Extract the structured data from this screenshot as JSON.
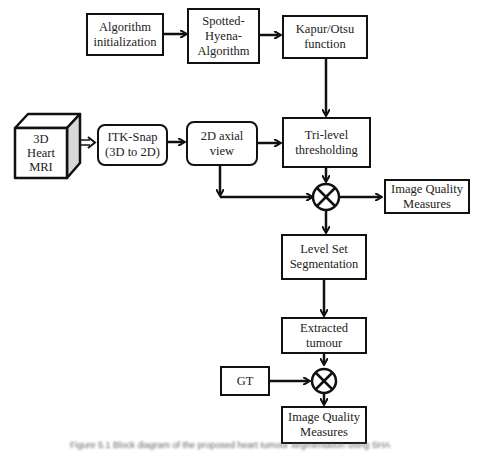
{
  "diagram": {
    "nodes": {
      "algo_init": "Algorithm initialization",
      "spotted_hyena": "Spotted-Hyena-Algorithm",
      "kapur_otsu": "Kapur/Otsu function",
      "heart_mri": "3D Heart MRI",
      "itk_snap": "ITK-Snap (3D to 2D)",
      "axial_view": "2D axial view",
      "tri_level": "Tri-level thresholding",
      "iqm1": "Image Quality Measures",
      "level_set": "Level Set Segmentation",
      "extracted": "Extracted tumour",
      "gt": "GT",
      "iqm2": "Image Quality Measures"
    },
    "lines": {
      "algo_init": [
        "Algorithm",
        "initialization"
      ],
      "spotted_hyena": [
        "Spotted-",
        "Hyena-",
        "Algorithm"
      ],
      "kapur_otsu": [
        "Kapur/Otsu",
        "function"
      ],
      "heart_mri": [
        "3D",
        "Heart",
        "MRI"
      ],
      "itk_snap": [
        "ITK-Snap",
        "(3D to 2D)"
      ],
      "axial_view": [
        "2D axial",
        "view"
      ],
      "tri_level": [
        "Tri-level",
        "thresholding"
      ],
      "iqm1": [
        "Image Quality",
        "Measures"
      ],
      "level_set": [
        "Level Set",
        "Segmentation"
      ],
      "extracted": [
        "Extracted",
        "tumour"
      ],
      "gt": [
        "GT"
      ],
      "iqm2": [
        "Image Quality",
        "Measures"
      ]
    },
    "edges": [
      [
        "Algorithm initialization",
        "Spotted-Hyena-Algorithm"
      ],
      [
        "Spotted-Hyena-Algorithm",
        "Kapur/Otsu function"
      ],
      [
        "Kapur/Otsu function",
        "Tri-level thresholding"
      ],
      [
        "3D Heart MRI",
        "ITK-Snap (3D to 2D)"
      ],
      [
        "ITK-Snap (3D to 2D)",
        "2D axial view"
      ],
      [
        "2D axial view",
        "Tri-level thresholding"
      ],
      [
        "2D axial view",
        "multiplier-1"
      ],
      [
        "Tri-level thresholding",
        "multiplier-1"
      ],
      [
        "multiplier-1",
        "Image Quality Measures"
      ],
      [
        "multiplier-1",
        "Level Set Segmentation"
      ],
      [
        "Level Set Segmentation",
        "Extracted tumour"
      ],
      [
        "Extracted tumour",
        "multiplier-2"
      ],
      [
        "GT",
        "multiplier-2"
      ],
      [
        "multiplier-2",
        "Image Quality Measures"
      ]
    ],
    "caption": "Figure 5.1  Block diagram of the proposed heart tumour segmentation using SHA"
  }
}
